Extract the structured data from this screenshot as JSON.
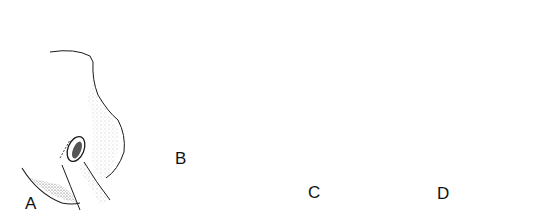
{
  "figure": {
    "panels": [
      {
        "label": "A"
      },
      {
        "label": "B"
      },
      {
        "label": "C"
      },
      {
        "label": "D"
      }
    ]
  },
  "colors": {
    "line": "#1a1a1a",
    "stipple": "#555555",
    "background": "#ffffff"
  }
}
